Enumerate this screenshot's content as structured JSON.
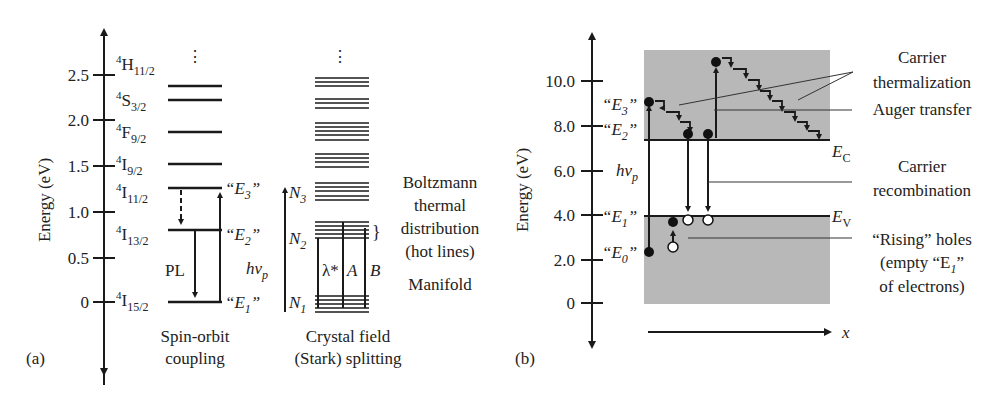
{
  "panel_a": {
    "label": "(a)",
    "y_axis_label": "Energy (eV)",
    "ticks": [
      "2.5",
      "2.0",
      "1.5",
      "1.0",
      "0.5",
      "0"
    ],
    "levels": [
      {
        "term": "4",
        "letter": "H",
        "sub": "11/2"
      },
      {
        "term": "4",
        "letter": "S",
        "sub": "3/2"
      },
      {
        "term": "4",
        "letter": "F",
        "sub": "9/2"
      },
      {
        "term": "4",
        "letter": "I",
        "sub": "9/2"
      },
      {
        "term": "4",
        "letter": "I",
        "sub": "11/2"
      },
      {
        "term": "4",
        "letter": "I",
        "sub": "13/2"
      },
      {
        "term": "4",
        "letter": "I",
        "sub": "15/2"
      }
    ],
    "e_labels": {
      "e3": "“E",
      "e3_sub": "3",
      "e2": "“E",
      "e2_sub": "2",
      "e1": "“E",
      "e1_sub": "1",
      "close": "”"
    },
    "pl_label": "PL",
    "dots": "⋮",
    "spin_orbit_caption_1": "Spin-orbit",
    "spin_orbit_caption_2": "coupling",
    "hv_label": "hν",
    "hv_sub": "p",
    "n3": "N",
    "n3_sub": "3",
    "n2": "N",
    "n2_sub": "2",
    "n1": "N",
    "n1_sub": "1",
    "lambda_label": "λ*",
    "a_label": "A",
    "b_label": "B",
    "brace": "}",
    "boltzmann_1": "Boltzmann",
    "boltzmann_2": "thermal",
    "boltzmann_3": "distribution",
    "boltzmann_4": "(hot lines)",
    "manifold": "Manifold",
    "stark_caption_1": "Crystal field",
    "stark_caption_2": "(Stark) splitting"
  },
  "panel_b": {
    "label": "(b)",
    "y_axis_label": "Energy (eV)",
    "ticks": [
      "10.0",
      "8.0",
      "6.0",
      "4.0",
      "2.0",
      "0"
    ],
    "e3": "“E",
    "e3_sub": "3",
    "e2": "“E",
    "e2_sub": "2",
    "e1": "“E",
    "e1_sub": "1",
    "e0": "“E",
    "e0_sub": "0",
    "close": "”",
    "hv_label": "hν",
    "hv_sub": "p",
    "ec_label": "E",
    "ec_sub": "C",
    "ev_label": "E",
    "ev_sub": "V",
    "x_label": "x",
    "carrier_therm_1": "Carrier",
    "carrier_therm_2": "thermalization",
    "auger": "Auger transfer",
    "recomb_1": "Carrier",
    "recomb_2": "recombination",
    "rising_1": "“Rising” holes",
    "rising_2": "(empty “E",
    "rising_2_sub": "1",
    "rising_2_end": "”",
    "rising_3": "of electrons)",
    "band_color": "#b8b8b8"
  }
}
